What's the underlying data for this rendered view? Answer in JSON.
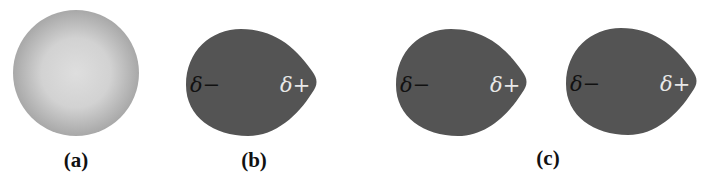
{
  "figure": {
    "colors": {
      "background": "#ffffff",
      "sphere_center": "#dcdcdc",
      "sphere_edge": "#a9a9a9",
      "blob_fill": "#545454",
      "negative_label": "#111111",
      "positive_label": "#e8e8e8"
    },
    "panels": [
      {
        "id": "a",
        "label": "(a)",
        "shapes": [
          {
            "type": "sphere",
            "description": "nonpolar atom, symmetric electron cloud"
          }
        ]
      },
      {
        "id": "b",
        "label": "(b)",
        "shapes": [
          {
            "type": "polarized-blob",
            "negative": "δ−",
            "positive": "δ+"
          }
        ]
      },
      {
        "id": "c",
        "label": "(c)",
        "shapes": [
          {
            "type": "polarized-blob",
            "negative": "δ−",
            "positive": "δ+"
          },
          {
            "type": "polarized-blob",
            "negative": "δ−",
            "positive": "δ+"
          }
        ]
      }
    ]
  }
}
